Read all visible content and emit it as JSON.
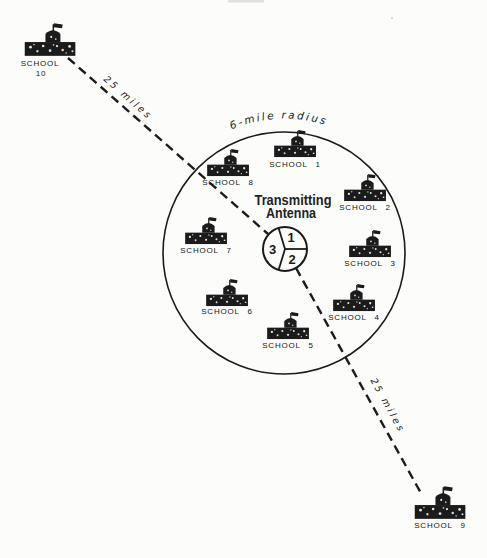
{
  "figure": {
    "radius_label": "6-mile radius",
    "antenna": {
      "title_line1": "Transmitting",
      "title_line2": "Antenna",
      "sector_1": "1",
      "sector_2": "2",
      "sector_3": "3"
    },
    "distance_top": "25 miles",
    "distance_bottom": "25 miles",
    "schools": [
      {
        "label": "SCHOOL 1"
      },
      {
        "label": "SCHOOL 2"
      },
      {
        "label": "SCHOOL 3"
      },
      {
        "label": "SCHOOL 4"
      },
      {
        "label": "SCHOOL 5"
      },
      {
        "label": "SCHOOL 6"
      },
      {
        "label": "SCHOOL 7"
      },
      {
        "label": "SCHOOL 8"
      },
      {
        "label": "SCHOOL 9"
      },
      {
        "label_line1": "SCHOOL",
        "label_line2": "10"
      }
    ],
    "colors": {
      "ink": "#1b1b1b",
      "paper": "#fcfcfb"
    }
  }
}
